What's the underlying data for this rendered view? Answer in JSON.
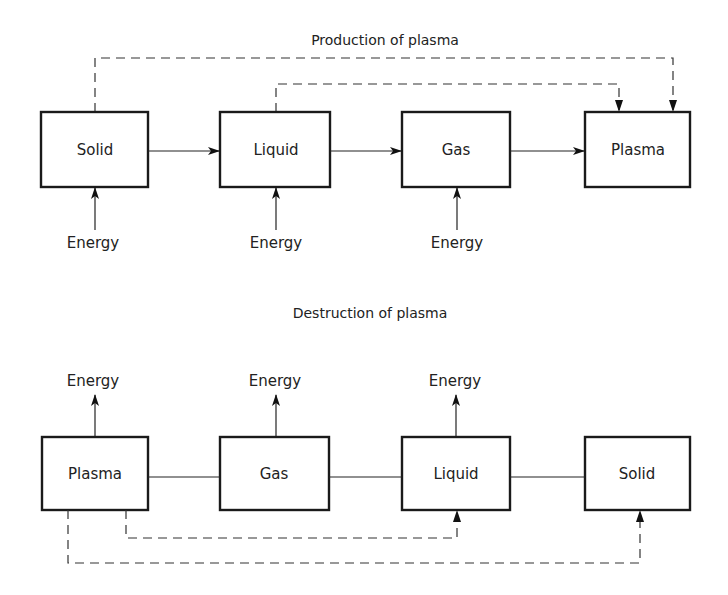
{
  "production": {
    "title": "Production of plasma",
    "states": [
      "Solid",
      "Liquid",
      "Gas",
      "Plasma"
    ],
    "energy_labels": [
      "Energy",
      "Energy",
      "Energy"
    ]
  },
  "destruction": {
    "title": "Destruction of plasma",
    "states": [
      "Plasma",
      "Gas",
      "Liquid",
      "Solid"
    ],
    "energy_labels": [
      "Energy",
      "Energy",
      "Energy"
    ]
  },
  "colors": {
    "stroke": "#1a1a1a",
    "background": "#ffffff"
  }
}
